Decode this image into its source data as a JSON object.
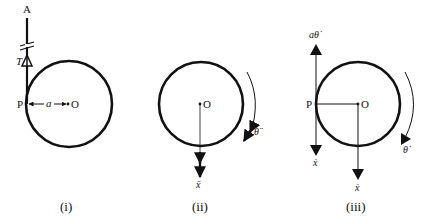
{
  "panels": [
    {
      "id": "i",
      "caption": "(i)",
      "labels": {
        "top_point": "A",
        "tension": "T",
        "contact_point": "P",
        "radius": "a",
        "center": "O"
      }
    },
    {
      "id": "ii",
      "caption": "(ii)",
      "labels": {
        "center": "O",
        "linear_accel": "ẍ",
        "angular_accel": "θ̈"
      }
    },
    {
      "id": "iii",
      "caption": "(iii)",
      "labels": {
        "contact_point": "P",
        "center": "O",
        "tangential_velocity": "aθ̇",
        "velocity_at_P": "ẋ",
        "velocity_at_O": "ẋ",
        "angular_velocity": "θ̇"
      }
    }
  ],
  "colors": {
    "ink": "#111111",
    "background": "#ffffff"
  }
}
